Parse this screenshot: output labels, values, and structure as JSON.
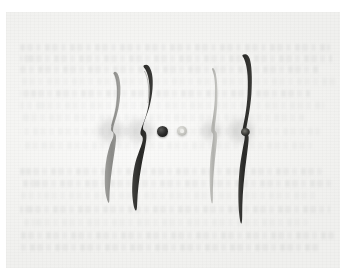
{
  "image": {
    "subject": "four model-aircraft propeller blades laid on a sheet of paper",
    "background_surface": "paper",
    "background_note": "faint blurred printed text showing through the paper",
    "margin_color": "#ffffff",
    "paper_color": "#f2f2f0"
  },
  "palette": {
    "paper": "#f2f2f0",
    "paper_highlight": "#fbfbfa",
    "margin": "#ffffff",
    "prop_dark": "#2f2f2d",
    "prop_dark_edge": "#1a1a18",
    "prop_gray": "#8e8e8b",
    "prop_light_gray": "#b8b8b4",
    "nut_dark": "#1d1d1c",
    "nut_light": "#c9c9c4",
    "ghost_text": "#7a7c80"
  },
  "objects": [
    {
      "id": "propeller-1",
      "name": "gray-propeller-left",
      "color": "#8e8e8b",
      "shade": "mid-gray",
      "shape": "two-blade S-curved propeller",
      "x": 96,
      "y": 73,
      "width": 30,
      "height": 128,
      "hub_x": 110,
      "hub_y": 131
    },
    {
      "id": "propeller-2",
      "name": "dark-propeller-inner-left",
      "color": "#2f2f2d",
      "shade": "near-black",
      "shape": "two-blade S-curved propeller, wide chord",
      "x": 124,
      "y": 66,
      "width": 32,
      "height": 144,
      "hub_x": 139,
      "hub_y": 131
    },
    {
      "id": "nut-dark",
      "name": "dark-prop-nut",
      "color": "#1d1d1c",
      "shade": "black",
      "shape": "round nut / washer",
      "x": 157,
      "y": 126,
      "width": 11,
      "height": 11
    },
    {
      "id": "nut-light",
      "name": "light-prop-nut",
      "color": "#c9c9c4",
      "shade": "light-gray",
      "shape": "round nut / washer with center hole",
      "x": 177,
      "y": 126,
      "width": 10,
      "height": 10
    },
    {
      "id": "propeller-3",
      "name": "light-gray-propeller-inner-right",
      "color": "#b8b8b4",
      "shade": "light-gray",
      "shape": "two-blade slender propeller",
      "x": 199,
      "y": 68,
      "width": 22,
      "height": 134,
      "hub_x": 210,
      "hub_y": 131
    },
    {
      "id": "propeller-4",
      "name": "dark-propeller-right",
      "color": "#2f2f2d",
      "shade": "near-black",
      "shape": "two-blade slender propeller with pronounced hub",
      "x": 226,
      "y": 55,
      "width": 30,
      "height": 165,
      "hub_x": 241,
      "hub_y": 131
    }
  ],
  "ghost_text_lines": [
    {
      "x": 14,
      "y": 44,
      "w": 310,
      "weight": "light"
    },
    {
      "x": 14,
      "y": 55,
      "w": 312,
      "weight": "light"
    },
    {
      "x": 14,
      "y": 66,
      "w": 300,
      "weight": "light"
    },
    {
      "x": 14,
      "y": 78,
      "w": 316,
      "weight": "faint"
    },
    {
      "x": 14,
      "y": 90,
      "w": 290,
      "weight": "light"
    },
    {
      "x": 14,
      "y": 102,
      "w": 304,
      "weight": "faint"
    },
    {
      "x": 14,
      "y": 114,
      "w": 284,
      "weight": "faint"
    },
    {
      "x": 14,
      "y": 128,
      "w": 300,
      "weight": "faint"
    },
    {
      "x": 14,
      "y": 142,
      "w": 292,
      "weight": "faint"
    },
    {
      "x": 14,
      "y": 168,
      "w": 306,
      "weight": "light"
    },
    {
      "x": 14,
      "y": 180,
      "w": 312,
      "weight": "light"
    },
    {
      "x": 14,
      "y": 192,
      "w": 298,
      "weight": "faint"
    },
    {
      "x": 14,
      "y": 206,
      "w": 310,
      "weight": "light"
    },
    {
      "x": 14,
      "y": 219,
      "w": 288,
      "weight": "faint"
    },
    {
      "x": 14,
      "y": 232,
      "w": 314,
      "weight": "light"
    },
    {
      "x": 14,
      "y": 244,
      "w": 300,
      "weight": "light"
    }
  ]
}
